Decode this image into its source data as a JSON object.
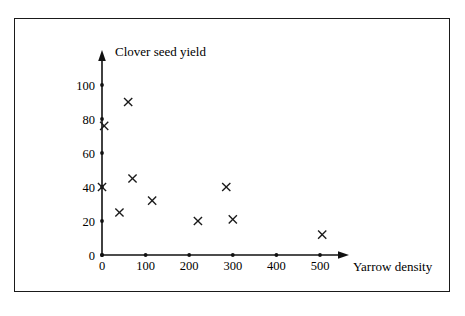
{
  "figure": {
    "frame_border_color": "#1a1a1a",
    "background_color": "#ffffff",
    "ink_color": "#1a1a1a"
  },
  "chart_data": {
    "type": "scatter",
    "title": "",
    "xlabel": "Yarrow density",
    "ylabel": "Clover seed yield",
    "xlim": [
      0,
      570
    ],
    "ylim": [
      0,
      112
    ],
    "grid": false,
    "legend": null,
    "marker": "x",
    "xticks": [
      0,
      100,
      200,
      300,
      400,
      500
    ],
    "xtick_labels": [
      "0",
      "100",
      "200",
      "300",
      "400",
      "500"
    ],
    "yticks": [
      0,
      20,
      40,
      60,
      80,
      100
    ],
    "ytick_labels": [
      "0",
      "20",
      "40",
      "60",
      "80",
      "100"
    ],
    "points": [
      {
        "x": 0,
        "y": 40
      },
      {
        "x": 5,
        "y": 76
      },
      {
        "x": 40,
        "y": 25
      },
      {
        "x": 60,
        "y": 90
      },
      {
        "x": 70,
        "y": 45
      },
      {
        "x": 115,
        "y": 32
      },
      {
        "x": 220,
        "y": 20
      },
      {
        "x": 285,
        "y": 40
      },
      {
        "x": 300,
        "y": 21
      },
      {
        "x": 505,
        "y": 12
      }
    ],
    "x": [
      0,
      5,
      40,
      60,
      70,
      115,
      220,
      285,
      300,
      505
    ],
    "values": [
      40,
      76,
      25,
      90,
      45,
      32,
      20,
      40,
      21,
      12
    ]
  },
  "labels": {
    "y_axis_title": "Clover seed yield",
    "x_axis_title": "Yarrow density",
    "y_ticks": [
      "0",
      "20",
      "40",
      "60",
      "80",
      "100"
    ],
    "x_ticks": [
      "0",
      "100",
      "200",
      "300",
      "400",
      "500"
    ]
  }
}
